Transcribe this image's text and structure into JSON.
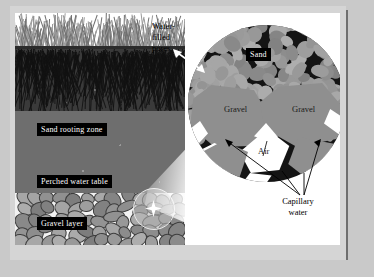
{
  "figure": {
    "background_color": "#c9c9c9",
    "plate_color": "#ffffff"
  },
  "profile": {
    "labels": {
      "sand_rooting_zone": "Sand rooting zone",
      "perched_water_table": "Perched water table",
      "gravel_layer": "Gravel layer"
    },
    "layers": [
      {
        "name": "grass-canopy",
        "color": "#ffffff"
      },
      {
        "name": "soil-surface-crust",
        "color": "#2b2b2b"
      },
      {
        "name": "root-zone",
        "color": "#3a3a3a"
      },
      {
        "name": "sand-body",
        "color": "#6e6e6e"
      },
      {
        "name": "gravel-layer",
        "color": "#f2f2f2"
      }
    ]
  },
  "callouts": {
    "water_filled_pores": "Water-\nfilled\npores",
    "water_filled_pores_lines": [
      "Water-",
      "filled",
      "pores"
    ]
  },
  "inset": {
    "labels": {
      "sand": "Sand",
      "gravel_left": "Gravel",
      "gravel_right": "Gravel",
      "air": "Air",
      "capillary_water_lines": [
        "Capillary",
        "water"
      ]
    },
    "colors": {
      "matrix": "#141414",
      "grain": "#8f8f8f",
      "air": "#ffffff",
      "capillary_water": "#ffffff"
    }
  }
}
